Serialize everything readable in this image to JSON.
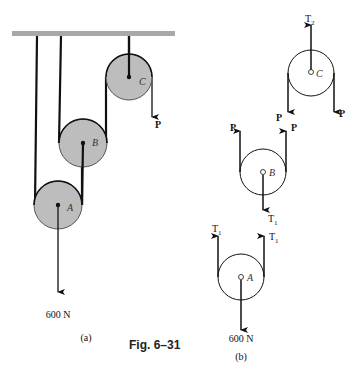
{
  "figure": {
    "caption": "Fig. 6–31",
    "part_a_label": "(a)",
    "part_b_label": "(b)"
  },
  "diagram_a": {
    "pulleys": [
      {
        "name": "A",
        "label": "A"
      },
      {
        "name": "B",
        "label": "B"
      },
      {
        "name": "C",
        "label": "C"
      }
    ],
    "force_P_label": "P",
    "load_label": "600 N"
  },
  "diagram_b": {
    "pulley_C": {
      "label": "C",
      "top_force": "T",
      "top_force_sub": "2",
      "left_force": "P",
      "right_force": "P"
    },
    "pulley_B": {
      "label": "B",
      "left_force": "P",
      "right_force": "P",
      "bottom_force": "T",
      "bottom_force_sub": "1"
    },
    "pulley_A": {
      "label": "A",
      "left_force": "T",
      "left_force_sub": "1",
      "right_force": "T",
      "right_force_sub": "1",
      "load": "600 N"
    }
  },
  "colors": {
    "pulley_fill": "#bdbdbd",
    "ceiling": "#a8a8a8",
    "rope": "#111111"
  }
}
